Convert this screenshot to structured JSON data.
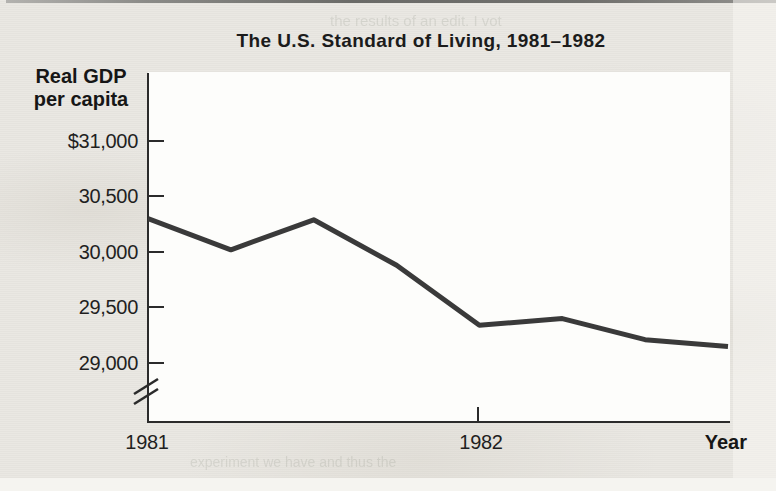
{
  "figure": {
    "title": "The U.S. Standard of Living, 1981–1982",
    "y_axis_title_line1": "Real GDP",
    "y_axis_title_line2": "per capita",
    "x_axis_title": "Year",
    "y_ticks": [
      "$31,000",
      "30,500",
      "30,000",
      "29,500",
      "29,000"
    ],
    "x_ticks": [
      "1981",
      "1982"
    ]
  },
  "chart_data": {
    "type": "line",
    "title": "The U.S. Standard of Living, 1981–1982",
    "ylabel": "Real GDP per capita",
    "xlabel": "Year",
    "x": [
      "1981 Q1",
      "1981 Q2",
      "1981 Q3",
      "1981 Q4",
      "1982 Q1",
      "1982 Q2",
      "1982 Q3",
      "1982 Q4"
    ],
    "values": [
      30300,
      30020,
      30290,
      29880,
      29340,
      29400,
      29210,
      29150
    ],
    "x_tick_labels_shown": [
      "1981",
      "1982"
    ],
    "y_tick_labels": [
      "$31,000",
      "30,500",
      "30,000",
      "29,500",
      "29,000"
    ],
    "ylim": [
      29000,
      31000
    ],
    "y_axis_break": true,
    "grid": false,
    "legend": false,
    "line_color": "#3a3a3a",
    "axis_color": "#2b2b2b"
  },
  "colors": {
    "page_background": "#e9e7e2",
    "plot_background": "#fdfdfb",
    "text": "#1b1b1b"
  },
  "bleedthrough": {
    "top_line": "the results of an edit. I vot",
    "right_lines": [
      "average ‘Curve’ a c",
      "and the hypo caus",
      "as above some that th",
      "executed — oeder (gg) or",
      "and thus an independent",
      "to copy the pend rises.",
      "so pleases a s",
      "test of went classes",
      "expenses — ing o",
      "o. Love — all the sig",
      "ately or reverse. We would",
      "pendent we’re we and thus"
    ],
    "bottom_line": "experiment we have and thus the"
  }
}
